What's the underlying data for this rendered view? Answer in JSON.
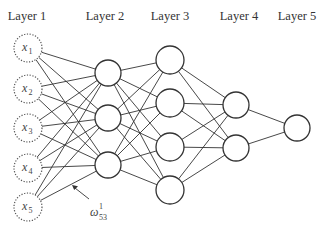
{
  "layers": [
    {
      "label": "Layer 1",
      "label_x": 27,
      "x": 28,
      "r": 14,
      "dashed": true,
      "nodes": [
        48,
        89,
        128,
        168,
        207
      ],
      "node_labels": [
        {
          "base": "x",
          "sub": "1"
        },
        {
          "base": "x",
          "sub": "2"
        },
        {
          "base": "x",
          "sub": "3"
        },
        {
          "base": "x",
          "sub": "4"
        },
        {
          "base": "x",
          "sub": "5"
        }
      ]
    },
    {
      "label": "Layer 2",
      "label_x": 105,
      "x": 108,
      "r": 13,
      "dashed": false,
      "nodes": [
        73,
        118,
        165
      ]
    },
    {
      "label": "Layer 3",
      "label_x": 170,
      "x": 170,
      "r": 14,
      "dashed": false,
      "nodes": [
        60,
        103,
        147,
        190
      ]
    },
    {
      "label": "Layer 4",
      "label_x": 239,
      "x": 236,
      "r": 13,
      "dashed": false,
      "nodes": [
        105,
        148
      ]
    },
    {
      "label": "Layer 5",
      "label_x": 297,
      "x": 297,
      "r": 13,
      "dashed": false,
      "nodes": [
        128
      ]
    }
  ],
  "label_y": 20,
  "annotation": {
    "symbol": "ω",
    "superscript": "1",
    "subscript": "53",
    "x": 90,
    "y": 212,
    "arrow_from": [
      89,
      199
    ],
    "arrow_to": [
      72,
      185
    ]
  }
}
